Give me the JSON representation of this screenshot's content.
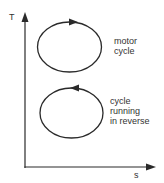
{
  "diagram": {
    "type": "T-s diagram",
    "axes": {
      "y_label": "T",
      "x_label": "s"
    },
    "cycles": [
      {
        "name": "motor cycle",
        "label_lines": [
          "motor",
          "cycle"
        ],
        "direction": "clockwise"
      },
      {
        "name": "cycle running in reverse",
        "label_lines": [
          "cycle",
          "running",
          "in reverse"
        ],
        "direction": "counterclockwise"
      }
    ],
    "colors": {
      "stroke": "#2a2a2a",
      "text": "#333333",
      "background": "#ffffff"
    }
  }
}
